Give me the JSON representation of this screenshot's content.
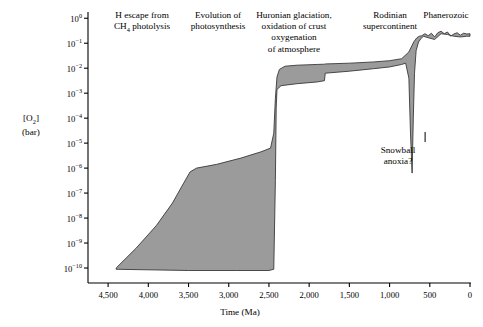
{
  "chart_data": {
    "type": "area",
    "title": "",
    "xlabel": "Time (Ma)",
    "ylabel": "[O2] (bar)",
    "ylabel_lines": [
      "[O2]",
      "(bar)"
    ],
    "xlim": [
      4750,
      0
    ],
    "ylim_exponents": [
      -10.6,
      0.25
    ],
    "x_ticks": [
      4500,
      4000,
      3500,
      3000,
      2500,
      2000,
      1500,
      1000,
      500,
      0
    ],
    "x_tick_labels": [
      "4,500",
      "4,000",
      "3,500",
      "3,000",
      "2,500",
      "2,000",
      "1,500",
      "1,000",
      "500",
      "0"
    ],
    "y_tick_exponents": [
      0,
      -1,
      -2,
      -3,
      -4,
      -5,
      -6,
      -7,
      -8,
      -9,
      -10
    ],
    "y_tick_labels": [
      "10^0",
      "10^-1",
      "10^-2",
      "10^-3",
      "10^-4",
      "10^-5",
      "10^-6",
      "10^-7",
      "10^-8",
      "10^-9",
      "10^-10"
    ],
    "grid": false,
    "legend": "none",
    "fill_color": "#9b9b9b",
    "stroke_color": "#3a3a3a",
    "series": [
      {
        "name": "Upper bound of atmospheric O2",
        "points": [
          [
            4400,
            -10.0
          ],
          [
            4150,
            -9.2
          ],
          [
            3900,
            -8.3
          ],
          [
            3700,
            -7.4
          ],
          [
            3560,
            -6.6
          ],
          [
            3480,
            -6.15
          ],
          [
            3400,
            -6.0
          ],
          [
            3150,
            -5.85
          ],
          [
            2850,
            -5.6
          ],
          [
            2600,
            -5.35
          ],
          [
            2480,
            -5.2
          ],
          [
            2440,
            -4.6
          ],
          [
            2420,
            -3.2
          ],
          [
            2400,
            -2.35
          ],
          [
            2370,
            -2.05
          ],
          [
            2300,
            -1.92
          ],
          [
            2150,
            -1.88
          ],
          [
            1900,
            -1.85
          ],
          [
            1810,
            -1.84
          ],
          [
            1800,
            -1.83
          ],
          [
            1500,
            -1.8
          ],
          [
            1200,
            -1.75
          ],
          [
            1000,
            -1.7
          ],
          [
            850,
            -1.62
          ],
          [
            760,
            -1.35
          ],
          [
            700,
            -0.95
          ],
          [
            660,
            -0.78
          ],
          [
            630,
            -0.72
          ],
          [
            600,
            -0.7
          ],
          [
            560,
            -0.62
          ],
          [
            520,
            -0.7
          ],
          [
            480,
            -0.6
          ],
          [
            440,
            -0.75
          ],
          [
            400,
            -0.58
          ],
          [
            360,
            -0.52
          ],
          [
            320,
            -0.62
          ],
          [
            280,
            -0.55
          ],
          [
            240,
            -0.72
          ],
          [
            200,
            -0.63
          ],
          [
            160,
            -0.58
          ],
          [
            120,
            -0.68
          ],
          [
            80,
            -0.6
          ],
          [
            40,
            -0.63
          ],
          [
            0,
            -0.62
          ]
        ]
      },
      {
        "name": "Lower bound of atmospheric O2",
        "points": [
          [
            4400,
            -10.05
          ],
          [
            3500,
            -10.1
          ],
          [
            2900,
            -10.1
          ],
          [
            2500,
            -10.1
          ],
          [
            2440,
            -10.05
          ],
          [
            2420,
            -6.5
          ],
          [
            2410,
            -3.6
          ],
          [
            2400,
            -2.85
          ],
          [
            2350,
            -2.7
          ],
          [
            2150,
            -2.62
          ],
          [
            1900,
            -2.55
          ],
          [
            1810,
            -2.5
          ],
          [
            1800,
            -2.2
          ],
          [
            1500,
            -2.12
          ],
          [
            1200,
            -2.02
          ],
          [
            1000,
            -1.95
          ],
          [
            850,
            -1.85
          ],
          [
            800,
            -1.8
          ],
          [
            760,
            -2.4
          ],
          [
            740,
            -4.6
          ],
          [
            720,
            -6.2
          ],
          [
            705,
            -4.0
          ],
          [
            690,
            -2.2
          ],
          [
            670,
            -1.3
          ],
          [
            640,
            -0.95
          ],
          [
            610,
            -0.82
          ],
          [
            580,
            -0.72
          ],
          [
            520,
            -0.78
          ],
          [
            440,
            -0.85
          ],
          [
            360,
            -0.62
          ],
          [
            280,
            -0.65
          ],
          [
            200,
            -0.72
          ],
          [
            120,
            -0.75
          ],
          [
            40,
            -0.72
          ],
          [
            0,
            -0.72
          ]
        ]
      }
    ],
    "annotations": [
      {
        "id": "h-escape",
        "text": "H escape from\nCH4 photolysis",
        "x_ma": 4050,
        "position": "top"
      },
      {
        "id": "photosynthesis",
        "text": "Evolution of\nphotosynthesis",
        "x_ma": 3150,
        "position": "top"
      },
      {
        "id": "huronian",
        "text": "Huronian glaciation,\noxidation of crust\noxygenation\nof atmosphere",
        "x_ma": 2300,
        "position": "top"
      },
      {
        "id": "rodinia",
        "text": "Rodinian\nsupercontinent",
        "x_ma": 1050,
        "position": "top"
      },
      {
        "id": "phanerozoic",
        "text": "Phanerozoic",
        "x_ma": 430,
        "position": "top"
      },
      {
        "id": "snowball",
        "text": "Snowball\nanoxia?",
        "x_ma": 720,
        "position": "inside",
        "has_pointer": true
      }
    ]
  },
  "figure": {
    "x_axis_title": "Time (Ma)",
    "y_axis_title_line1": "[O2]",
    "y_axis_title_line2": "(bar)"
  },
  "labels": {
    "h_escape": "H escape from\nCH4 photolysis",
    "photosynthesis": "Evolution of\nphotosynthesis",
    "huronian": "Huronian glaciation,\noxidation of crust\noxygenation\nof atmosphere",
    "rodinia": "Rodinian\nsupercontinent",
    "phanerozoic": "Phanerozoic",
    "snowball": "Snowball\nanoxia?"
  }
}
